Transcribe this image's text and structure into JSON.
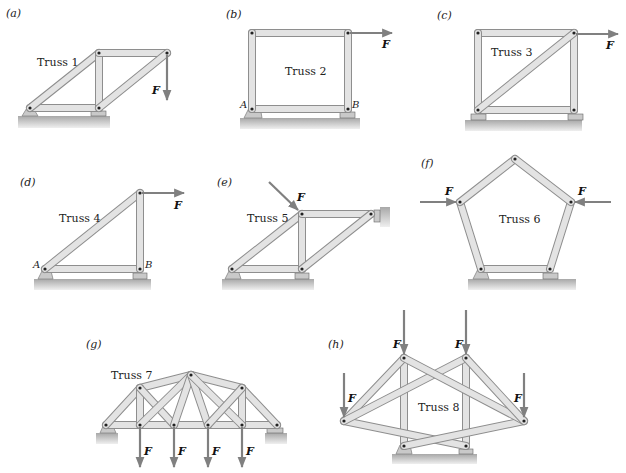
{
  "figure": {
    "panels": [
      {
        "id": "a",
        "label": "(a)",
        "title": "Truss 1",
        "forces": [
          "F"
        ],
        "points": []
      },
      {
        "id": "b",
        "label": "(b)",
        "title": "Truss 2",
        "forces": [
          "F"
        ],
        "points": [
          "A",
          "B"
        ]
      },
      {
        "id": "c",
        "label": "(c)",
        "title": "Truss 3",
        "forces": [
          "F"
        ],
        "points": []
      },
      {
        "id": "d",
        "label": "(d)",
        "title": "Truss 4",
        "forces": [
          "F"
        ],
        "points": [
          "A",
          "B"
        ]
      },
      {
        "id": "e",
        "label": "(e)",
        "title": "Truss 5",
        "forces": [
          "F"
        ],
        "points": []
      },
      {
        "id": "f",
        "label": "(f)",
        "title": "Truss 6",
        "forces": [
          "F",
          "F"
        ],
        "points": []
      },
      {
        "id": "g",
        "label": "(g)",
        "title": "Truss 7",
        "forces": [
          "F",
          "F",
          "F",
          "F"
        ],
        "points": []
      },
      {
        "id": "h",
        "label": "(h)",
        "title": "Truss 8",
        "forces": [
          "F",
          "F",
          "F",
          "F"
        ],
        "points": []
      }
    ]
  },
  "colors": {
    "member_edge": "#8e8e8e",
    "member_fill": "#e3e3e3",
    "arrow": "#808080",
    "ground": "#b0b0b0",
    "text": "#222222"
  }
}
